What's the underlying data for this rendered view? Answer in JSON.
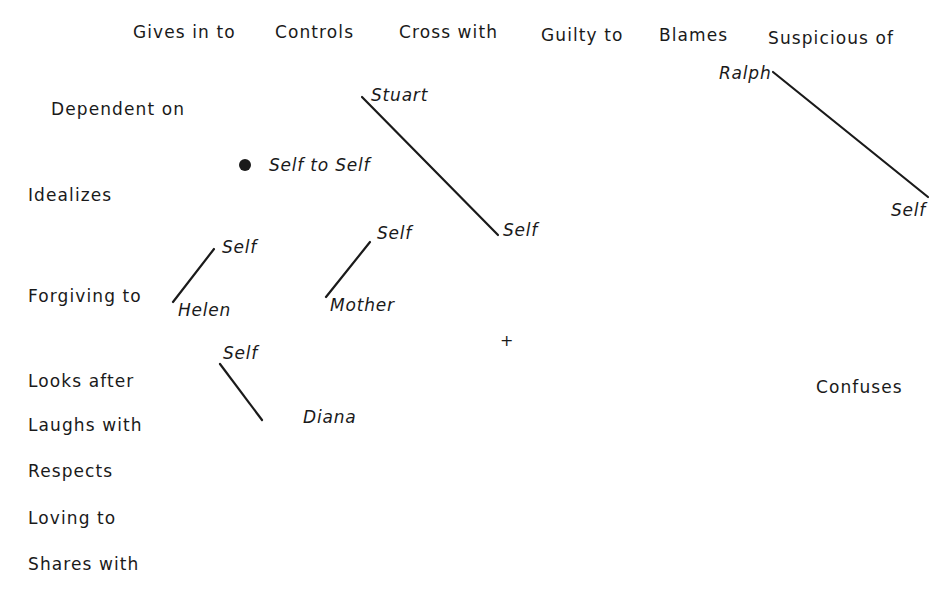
{
  "top_constructs": [
    {
      "label": "Gives in to",
      "x": 133,
      "y": 24
    },
    {
      "label": "Controls",
      "x": 275,
      "y": 24
    },
    {
      "label": "Cross with",
      "x": 399,
      "y": 24
    },
    {
      "label": "Guilty to",
      "x": 541,
      "y": 27
    },
    {
      "label": "Blames",
      "x": 659,
      "y": 27
    },
    {
      "label": "Suspicious of",
      "x": 768,
      "y": 30
    }
  ],
  "left_constructs": [
    {
      "label": "Dependent on",
      "x": 51,
      "y": 101
    },
    {
      "label": "Idealizes",
      "x": 28,
      "y": 187
    },
    {
      "label": "Forgiving to",
      "x": 28,
      "y": 288
    },
    {
      "label": "Looks after",
      "x": 28,
      "y": 373
    },
    {
      "label": "Laughs with",
      "x": 28,
      "y": 417
    },
    {
      "label": "Respects",
      "x": 28,
      "y": 463
    },
    {
      "label": "Loving to",
      "x": 28,
      "y": 510
    },
    {
      "label": "Shares with",
      "x": 28,
      "y": 556
    }
  ],
  "right_constructs": [
    {
      "label": "Confuses",
      "x": 816,
      "y": 379
    }
  ],
  "elements": [
    {
      "label": "Stuart",
      "x": 371,
      "y": 87
    },
    {
      "label": "Self",
      "x": 503,
      "y": 222
    },
    {
      "label": "Ralph",
      "x": 719,
      "y": 65
    },
    {
      "label": "Self",
      "x": 891,
      "y": 202
    },
    {
      "label": "Self to Self",
      "x": 269,
      "y": 157
    },
    {
      "label": "Self",
      "x": 222,
      "y": 239
    },
    {
      "label": "Helen",
      "x": 178,
      "y": 302
    },
    {
      "label": "Self",
      "x": 377,
      "y": 225
    },
    {
      "label": "Mother",
      "x": 330,
      "y": 297
    },
    {
      "label": "Self",
      "x": 223,
      "y": 345
    },
    {
      "label": "Diana",
      "x": 303,
      "y": 409
    }
  ],
  "relationship_lines": [
    {
      "from": "Stuart",
      "to": "Self",
      "x1": 362,
      "y1": 97,
      "x2": 498,
      "y2": 235
    },
    {
      "from": "Ralph",
      "to": "Self",
      "x1": 773,
      "y1": 72,
      "x2": 928,
      "y2": 197
    },
    {
      "from": "Helen",
      "to": "Self",
      "x1": 173,
      "y1": 302,
      "x2": 214,
      "y2": 249
    },
    {
      "from": "Mother",
      "to": "Self",
      "x1": 326,
      "y1": 297,
      "x2": 370,
      "y2": 242
    },
    {
      "from": "Self",
      "to": "Diana",
      "x1": 220,
      "y1": 364,
      "x2": 262,
      "y2": 420
    }
  ],
  "self_to_self_point": {
    "cx": 245,
    "cy": 165,
    "r": 6
  },
  "origin_marker": {
    "symbol": "+",
    "x": 500,
    "y": 333
  },
  "colors": {
    "ink": "#1a1a1a",
    "background": "#ffffff"
  }
}
